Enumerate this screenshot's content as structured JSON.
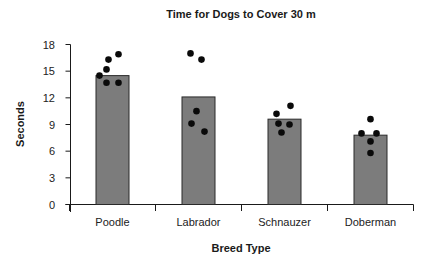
{
  "chart_data": {
    "type": "bar",
    "title": "Time for Dogs to Cover 30 m",
    "xlabel": "Breed Type",
    "ylabel": "Seconds",
    "ylim": [
      0,
      18
    ],
    "yticks": [
      0,
      3,
      6,
      9,
      12,
      15,
      18
    ],
    "grid": false,
    "legend": null,
    "categories": [
      "Poodle",
      "Labrador",
      "Schnauzer",
      "Doberman"
    ],
    "values": [
      14.5,
      12.1,
      9.6,
      7.8
    ],
    "individual_points": [
      {
        "category": "Poodle",
        "values": [
          16.9,
          16.3,
          15.2,
          14.5,
          13.7,
          13.7
        ]
      },
      {
        "category": "Labrador",
        "values": [
          17.0,
          16.3,
          10.5,
          9.1,
          8.2
        ]
      },
      {
        "category": "Schnauzer",
        "values": [
          11.1,
          10.2,
          9.1,
          9.0,
          8.1
        ]
      },
      {
        "category": "Doberman",
        "values": [
          9.6,
          8.0,
          8.0,
          7.1,
          5.8
        ]
      }
    ],
    "colors": {
      "bar_fill": "#7c7c7c",
      "bar_stroke": "#2a2a2a",
      "dot": "#0a0a0a"
    }
  }
}
